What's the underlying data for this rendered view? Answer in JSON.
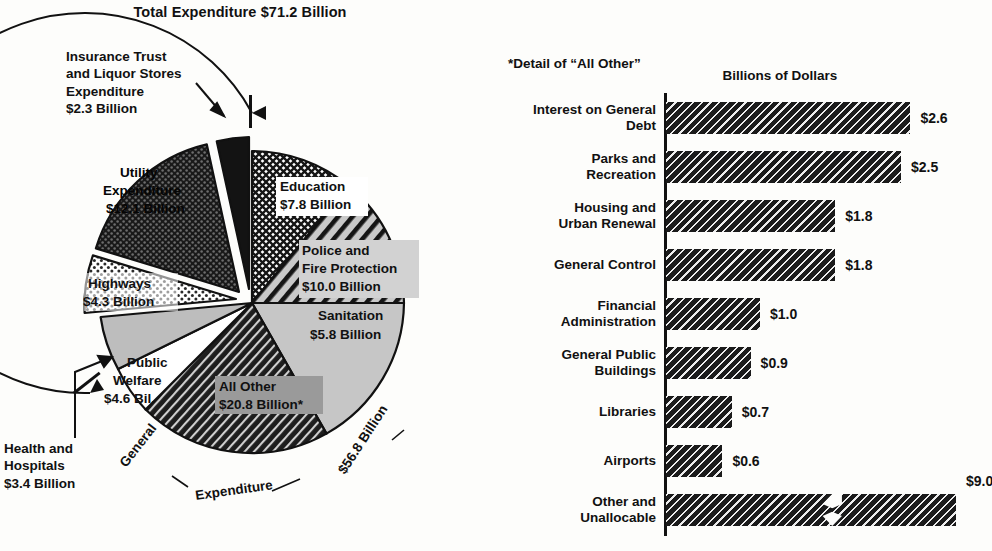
{
  "pie": {
    "title": "Total Expenditure $71.2 Billion",
    "callouts": {
      "insurance": [
        "Insurance Trust",
        "and Liquor Stores",
        "Expenditure",
        "$2.3 Billion"
      ],
      "health": [
        "Health and",
        "Hospitals",
        "$3.4 Billion"
      ]
    },
    "arc_labels": {
      "general": "General",
      "expenditure": "Expenditure",
      "general_total": "$56.8 Billion"
    }
  },
  "bars": {
    "footnote": "*Detail of “All Other”",
    "axis_title": "Billions of Dollars"
  },
  "chart_data": [
    {
      "type": "pie",
      "title": "Total Expenditure $71.2 Billion",
      "total": 71.2,
      "units": "Billions of Dollars",
      "labels_inside": true,
      "categories": [
        "Education",
        "Police and Fire Protection",
        "Sanitation",
        "All Other",
        "Health and Hospitals",
        "Public Welfare",
        "Highways",
        "Utility Expenditure",
        "Insurance Trust and Liquor Stores Expenditure"
      ],
      "values": [
        7.8,
        10.0,
        5.8,
        20.8,
        3.4,
        4.6,
        4.3,
        12.1,
        2.3
      ],
      "slices": [
        {
          "label": "Education",
          "label_lines": [
            "Education",
            "$7.8 Billion"
          ],
          "value": 7.8,
          "value_text": "$7.8 Billion",
          "fill": "crosshatch",
          "exploded": false,
          "group": "General Expenditure"
        },
        {
          "label": "Police and Fire Protection",
          "label_lines": [
            "Police and",
            "Fire Protection",
            "$10.0 Billion"
          ],
          "value": 10.0,
          "value_text": "$10.0 Billion",
          "fill": "diagonal-wide",
          "exploded": false,
          "group": "General Expenditure"
        },
        {
          "label": "Sanitation",
          "label_lines": [
            "Sanitation",
            "$5.8 Billion"
          ],
          "value": 5.8,
          "value_text": "$5.8 Billion",
          "fill": "light-gray",
          "exploded": false,
          "group": "General Expenditure"
        },
        {
          "label": "All Other",
          "label_lines": [
            "All Other",
            "$20.8 Billion*"
          ],
          "value": 20.8,
          "value_text": "$20.8 Billion",
          "fill": "diagonal-dense",
          "exploded": false,
          "group": "General Expenditure",
          "footnote_marker": "*"
        },
        {
          "label": "Health and Hospitals",
          "label_lines": [],
          "value": 3.4,
          "value_text": "$3.4 Billion",
          "fill": "white",
          "exploded": false,
          "group": "General Expenditure",
          "callout": true
        },
        {
          "label": "Public Welfare",
          "label_lines": [
            "Public",
            "Welfare",
            "$4.6 Bil."
          ],
          "value": 4.6,
          "value_text": "$4.6 Bil.",
          "fill": "mid-gray",
          "exploded": false,
          "group": "General Expenditure"
        },
        {
          "label": "Highways",
          "label_lines": [
            "Highways",
            "$4.3 Billion"
          ],
          "value": 4.3,
          "value_text": "$4.3 Billion",
          "fill": "dots-light",
          "exploded": true,
          "group": "General Expenditure"
        },
        {
          "label": "Utility Expenditure",
          "label_lines": [
            "Utility",
            "Expenditure",
            "$12.1 Billion"
          ],
          "value": 12.1,
          "value_text": "$12.1 Billion",
          "fill": "dots-dark",
          "exploded": true,
          "group": "Utility"
        },
        {
          "label": "Insurance Trust and Liquor Stores Expenditure",
          "label_lines": [],
          "value": 2.3,
          "value_text": "$2.3 Billion",
          "fill": "black",
          "exploded": true,
          "group": "Insurance Trust",
          "callout": true
        }
      ],
      "groups": [
        {
          "name": "General Expenditure",
          "value": 56.8,
          "value_text": "$56.8 Billion"
        }
      ]
    },
    {
      "type": "bar",
      "orientation": "horizontal",
      "title": "*Detail of “All Other”",
      "xlabel": "Billions of Dollars",
      "ylabel": "",
      "xlim": [
        0,
        2.8
      ],
      "grid": false,
      "categories": [
        "Interest on General Debt",
        "Parks and Recreation",
        "Housing and Urban Renewal",
        "General Control",
        "Financial Administration",
        "General Public Buildings",
        "Libraries",
        "Airports",
        "Other and Unallocable"
      ],
      "values": [
        2.6,
        2.5,
        1.8,
        1.8,
        1.0,
        0.9,
        0.7,
        0.6,
        9.0
      ],
      "items": [
        {
          "label_lines": [
            "Interest on General",
            "Debt"
          ],
          "value": 2.6,
          "value_text": "$2.6",
          "broken_axis": false
        },
        {
          "label_lines": [
            "Parks and",
            "Recreation"
          ],
          "value": 2.5,
          "value_text": "$2.5",
          "broken_axis": false
        },
        {
          "label_lines": [
            "Housing and",
            "Urban Renewal"
          ],
          "value": 1.8,
          "value_text": "$1.8",
          "broken_axis": false
        },
        {
          "label_lines": [
            "General Control"
          ],
          "value": 1.8,
          "value_text": "$1.8",
          "broken_axis": false
        },
        {
          "label_lines": [
            "Financial",
            "Administration"
          ],
          "value": 1.0,
          "value_text": "$1.0",
          "broken_axis": false
        },
        {
          "label_lines": [
            "General Public",
            "Buildings"
          ],
          "value": 0.9,
          "value_text": "$0.9",
          "broken_axis": false
        },
        {
          "label_lines": [
            "Libraries"
          ],
          "value": 0.7,
          "value_text": "$0.7",
          "broken_axis": false
        },
        {
          "label_lines": [
            "Airports"
          ],
          "value": 0.6,
          "value_text": "$0.6",
          "broken_axis": false
        },
        {
          "label_lines": [
            "Other and",
            "Unallocable"
          ],
          "value": 9.0,
          "value_text": "$9.0",
          "broken_axis": true
        }
      ]
    }
  ]
}
